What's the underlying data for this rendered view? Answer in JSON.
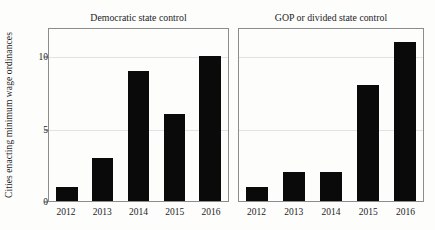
{
  "chart_data": {
    "type": "bar",
    "title": "",
    "xlabel": "",
    "ylabel": "Cities enacting minimum wage ordinances",
    "ylim": [
      0,
      12
    ],
    "yticks": [
      0,
      5,
      10
    ],
    "ytick_labels": [
      "0",
      "5",
      "10"
    ],
    "grid": true,
    "gridlines_at": [
      5,
      10
    ],
    "legend": "none",
    "bar_color": "#0a0a0a",
    "categories": [
      "2012",
      "2013",
      "2014",
      "2015",
      "2016"
    ],
    "panels": [
      {
        "title": "Democratic state control",
        "categories": [
          "2012",
          "2013",
          "2014",
          "2015",
          "2016"
        ],
        "values": [
          1,
          3,
          9,
          6,
          10
        ]
      },
      {
        "title": "GOP or divided state control",
        "categories": [
          "2012",
          "2013",
          "2014",
          "2015",
          "2016"
        ],
        "values": [
          1,
          2,
          2,
          8,
          11
        ]
      }
    ]
  }
}
